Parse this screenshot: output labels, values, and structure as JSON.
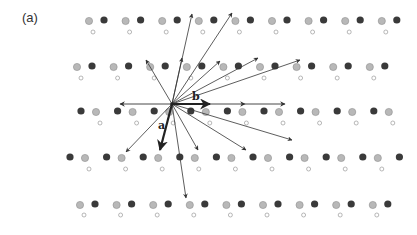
{
  "figure": {
    "panel_label": "(a)",
    "origin": {
      "x": 172,
      "y": 104
    },
    "colors": {
      "dark_atom": "#3a3a3a",
      "light_atom": "#b8b8b8",
      "light_atom_stroke": "#8f8f8f",
      "ring_atom_stroke": "#9a9a9a",
      "vector": "#333333"
    },
    "basis_vectors": [
      {
        "label": "b",
        "to": {
          "x": 210,
          "y": 104
        },
        "label_pos": {
          "x": 192,
          "y": 100
        }
      },
      {
        "label": "a",
        "to": {
          "x": 160,
          "y": 150
        },
        "label_pos": {
          "x": 158,
          "y": 129
        }
      }
    ],
    "horizontal_axis": {
      "from": {
        "x": 120,
        "y": 104
      },
      "to": {
        "x": 285,
        "y": 104
      },
      "mid_arrow_x": 245
    },
    "vectors": [
      {
        "to": {
          "x": 146,
          "y": 60
        }
      },
      {
        "to": {
          "x": 192,
          "y": 14
        }
      },
      {
        "to": {
          "x": 232,
          "y": 13
        }
      },
      {
        "to": {
          "x": 182,
          "y": 58
        }
      },
      {
        "to": {
          "x": 220,
          "y": 61
        }
      },
      {
        "to": {
          "x": 258,
          "y": 58
        }
      },
      {
        "to": {
          "x": 300,
          "y": 60
        }
      },
      {
        "to": {
          "x": 126,
          "y": 152
        }
      },
      {
        "to": {
          "x": 186,
          "y": 198
        }
      },
      {
        "to": {
          "x": 198,
          "y": 150
        }
      },
      {
        "to": {
          "x": 246,
          "y": 150
        }
      },
      {
        "to": {
          "x": 292,
          "y": 140
        }
      }
    ],
    "rows": [
      {
        "y": 20,
        "ring_dy": 12,
        "start_x": 89,
        "pattern": "light-dark",
        "count": 9,
        "spacing": 36.6
      },
      {
        "y": 66,
        "ring_dy": 12,
        "start_x": 77,
        "pattern": "light-dark",
        "count": 9,
        "spacing": 36.6
      },
      {
        "y": 111,
        "ring_dy": 12,
        "start_x": 81,
        "pattern": "dark-light",
        "count": 9,
        "spacing": 36.6
      },
      {
        "y": 157,
        "ring_dy": 12,
        "start_x": 70,
        "pattern": "dark-light",
        "count": 10,
        "spacing": 36.6
      },
      {
        "y": 204,
        "ring_dy": 11,
        "start_x": 80,
        "pattern": "light-dark",
        "count": 9,
        "spacing": 36.6
      }
    ]
  }
}
